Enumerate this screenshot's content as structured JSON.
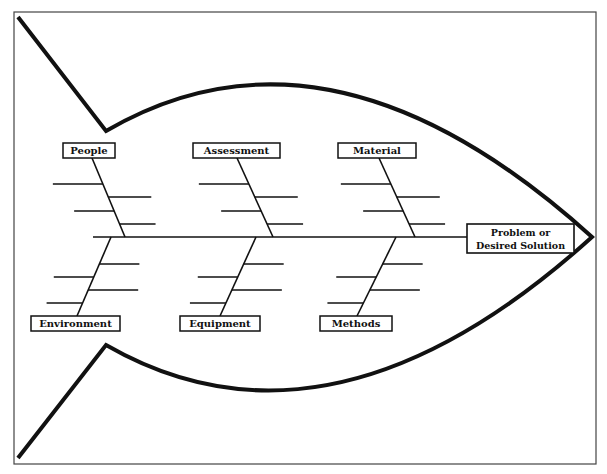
{
  "diagram": {
    "type": "fishbone",
    "title": "",
    "head": {
      "lines": [
        "Problem or",
        "Desired Solution"
      ]
    },
    "causes_top": [
      {
        "label": "People",
        "sub_causes": [
          "",
          "",
          "",
          ""
        ]
      },
      {
        "label": "Assessment",
        "sub_causes": [
          "",
          "",
          "",
          ""
        ]
      },
      {
        "label": "Material",
        "sub_causes": [
          "",
          "",
          "",
          ""
        ]
      }
    ],
    "causes_bottom": [
      {
        "label": "Environment",
        "sub_causes": [
          "",
          "",
          "",
          ""
        ]
      },
      {
        "label": "Equipment",
        "sub_causes": [
          "",
          "",
          "",
          ""
        ]
      },
      {
        "label": "Methods",
        "sub_causes": [
          "",
          "",
          "",
          ""
        ]
      }
    ],
    "colors": {
      "line": "#111111",
      "frame": "#444444",
      "background": "#ffffff"
    }
  }
}
